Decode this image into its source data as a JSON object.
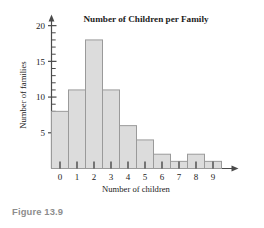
{
  "figure": {
    "caption": "Figure 13.9"
  },
  "chart_data": {
    "type": "bar",
    "title": "Number of Children per Family",
    "xlabel": "Number of children",
    "ylabel": "Number of families",
    "categories": [
      "0",
      "1",
      "2",
      "3",
      "4",
      "5",
      "6",
      "7",
      "8",
      "9"
    ],
    "values": [
      8,
      11,
      18,
      11,
      6,
      4,
      2,
      1,
      2,
      1
    ],
    "xlim": [
      -0.5,
      9.5
    ],
    "ylim": [
      0,
      21
    ],
    "ytick_labels": [
      "5",
      "10",
      "15",
      "20"
    ],
    "ytick_values": [
      5,
      10,
      15,
      20
    ],
    "yminor_step": 1,
    "grid": false,
    "legend": false,
    "bar_fill": "#dcdcdc",
    "bar_stroke": "#9a9a9a",
    "axis_color": "#4a4a4a",
    "caption_color": "#8d8d8d",
    "axis_style": "arrow-ended"
  }
}
